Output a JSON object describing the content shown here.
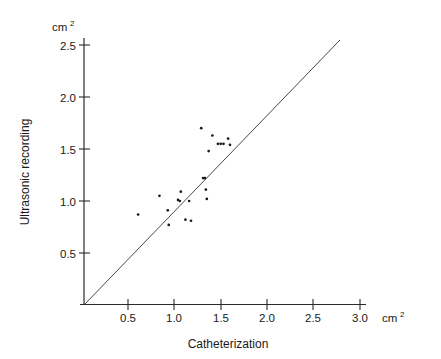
{
  "chart_data": {
    "type": "scatter",
    "title": "",
    "xlabel": "Catheterization",
    "ylabel": "Ultrasonic recording",
    "x_unit": "cm2",
    "y_unit": "cm2",
    "xlim": [
      0,
      3.1
    ],
    "ylim": [
      0,
      2.6
    ],
    "x_ticks": [
      0.5,
      1.0,
      1.5,
      2.0,
      2.5,
      3.0
    ],
    "x_tick_labels": [
      "0.5",
      "1.0",
      "1.5",
      "2.0",
      "2.5",
      "3.0"
    ],
    "y_ticks": [
      0.5,
      1.0,
      1.5,
      2.0,
      2.5
    ],
    "y_tick_labels": [
      "0.5",
      "1.0",
      "1.5",
      "2.0",
      "2.5"
    ],
    "grid": false,
    "legend": false,
    "reference_line": {
      "name": "identity-line",
      "from": [
        0.0,
        0.0
      ],
      "to": [
        2.57,
        2.57
      ],
      "label": "line of identity"
    },
    "points": [
      {
        "x": 0.61,
        "y": 0.87
      },
      {
        "x": 0.84,
        "y": 1.05
      },
      {
        "x": 0.93,
        "y": 0.91
      },
      {
        "x": 0.94,
        "y": 0.77
      },
      {
        "x": 1.04,
        "y": 1.01
      },
      {
        "x": 1.06,
        "y": 1.0
      },
      {
        "x": 1.07,
        "y": 1.09
      },
      {
        "x": 1.12,
        "y": 0.82
      },
      {
        "x": 1.16,
        "y": 1.0
      },
      {
        "x": 1.18,
        "y": 0.81
      },
      {
        "x": 1.29,
        "y": 1.7
      },
      {
        "x": 1.31,
        "y": 1.22
      },
      {
        "x": 1.33,
        "y": 1.22
      },
      {
        "x": 1.34,
        "y": 1.11
      },
      {
        "x": 1.35,
        "y": 1.02
      },
      {
        "x": 1.37,
        "y": 1.48
      },
      {
        "x": 1.41,
        "y": 1.63
      },
      {
        "x": 1.47,
        "y": 1.55
      },
      {
        "x": 1.5,
        "y": 1.55
      },
      {
        "x": 1.53,
        "y": 1.55
      },
      {
        "x": 1.58,
        "y": 1.6
      },
      {
        "x": 1.6,
        "y": 1.54
      }
    ]
  },
  "axes": {
    "y_unit_label": "cm",
    "y_unit_sup": "2",
    "x_unit_label": "cm",
    "x_unit_sup": "2",
    "x_title": "Catheterization",
    "y_title": "Ultrasonic recording"
  },
  "colors": {
    "point": "#1a1a1a",
    "axis": "#2a2a2a",
    "line": "#333333",
    "background": "#ffffff"
  }
}
